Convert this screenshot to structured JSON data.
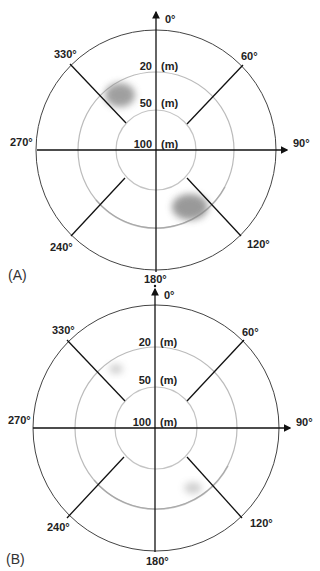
{
  "figure": {
    "panels": [
      {
        "id": "A",
        "label": "(A)",
        "center": [
          156,
          150
        ],
        "radii": {
          "outer": 120,
          "middle": 78,
          "inner": 40
        },
        "angle_labels": {
          "n": "0°",
          "ne": "60°",
          "e": "90°",
          "se": "120°",
          "s": "180°",
          "sw": "240°",
          "w": "270°",
          "nw": "330°"
        },
        "range_labels": [
          {
            "value": "20",
            "unit": "(m)"
          },
          {
            "value": "50",
            "unit": "(m)"
          },
          {
            "value": "100",
            "unit": "(m)"
          }
        ],
        "blobs": [
          {
            "cx": 120,
            "cy": 95,
            "rx": 15,
            "ry": 12,
            "opacity": 0.75
          },
          {
            "cx": 190,
            "cy": 207,
            "rx": 18,
            "ry": 13,
            "opacity": 0.8
          }
        ]
      },
      {
        "id": "B",
        "label": "(B)",
        "center": [
          156,
          428
        ],
        "radii": {
          "outer": 123,
          "middle": 81,
          "inner": 41
        },
        "angle_labels": {
          "n": "0°",
          "ne": "60°",
          "e": "90°",
          "se": "120°",
          "s": "180°",
          "sw": "240°",
          "w": "270°",
          "nw": "330°"
        },
        "range_labels": [
          {
            "value": "20",
            "unit": "(m)"
          },
          {
            "value": "50",
            "unit": "(m)"
          },
          {
            "value": "100",
            "unit": "(m)"
          }
        ],
        "blobs": [
          {
            "cx": 116,
            "cy": 369,
            "rx": 7,
            "ry": 5,
            "opacity": 0.35
          },
          {
            "cx": 193,
            "cy": 488,
            "rx": 9,
            "ry": 6,
            "opacity": 0.35
          }
        ]
      }
    ]
  },
  "colors": {
    "axis": "#111111",
    "outer_circle": "#444444",
    "middle_circle": "#bdbdbd",
    "inner_circle": "#c8c8c8",
    "blob": "#8a8a8a"
  }
}
